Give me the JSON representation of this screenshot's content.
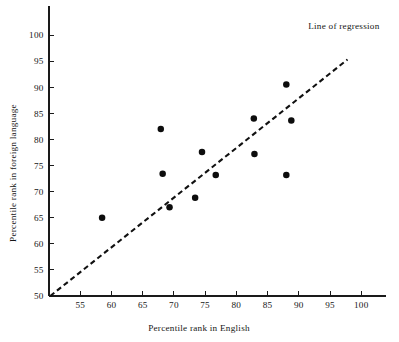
{
  "chart_data": {
    "type": "scatter",
    "title": "",
    "xlabel": "Percentile rank in English",
    "ylabel": "Percentile rank in foreign language",
    "xlim": [
      50,
      104
    ],
    "ylim": [
      50,
      104
    ],
    "xticks": [
      55,
      60,
      65,
      70,
      75,
      80,
      85,
      90,
      95,
      100
    ],
    "xtick_labels": [
      "55",
      "60",
      "65",
      "70",
      "75",
      "80",
      "85",
      "90",
      "95",
      "100"
    ],
    "yticks": [
      50,
      55,
      60,
      65,
      70,
      75,
      80,
      85,
      90,
      95,
      100
    ],
    "ytick_labels": [
      "50",
      "55",
      "60",
      "65",
      "70",
      "75",
      "80",
      "85",
      "90",
      "95",
      "100"
    ],
    "grid": false,
    "legend": false,
    "series": [
      {
        "name": "students",
        "marker": "filled-circle",
        "color": "#0d0d0d",
        "points": [
          {
            "x": 58.5,
            "y": 65.0
          },
          {
            "x": 67.9,
            "y": 82.0
          },
          {
            "x": 68.2,
            "y": 73.4
          },
          {
            "x": 69.3,
            "y": 67.0
          },
          {
            "x": 73.4,
            "y": 68.8
          },
          {
            "x": 74.5,
            "y": 77.6
          },
          {
            "x": 76.7,
            "y": 73.2
          },
          {
            "x": 82.8,
            "y": 84.0
          },
          {
            "x": 82.9,
            "y": 77.2
          },
          {
            "x": 88.0,
            "y": 90.5
          },
          {
            "x": 88.8,
            "y": 83.6
          },
          {
            "x": 88.0,
            "y": 73.2
          }
        ]
      }
    ],
    "annotations": [
      {
        "name": "regression-line",
        "type": "line",
        "style": "dashed",
        "color": "#111111",
        "x0": 50.2,
        "y0": 50.0,
        "x1": 97.8,
        "y1": 95.3
      },
      {
        "name": "regression-label",
        "type": "text",
        "text": "Line of regression",
        "x": 91.5,
        "y": 101.2
      }
    ]
  },
  "axes": {
    "x_title": "Percentile rank in English",
    "y_title": "Percentile rank in foreign language"
  },
  "annotation_text": {
    "regression": "Line of regression"
  },
  "colors": {
    "axis": "#1a1a1a",
    "point": "#0d0d0d",
    "line": "#111111",
    "background": "#ffffff"
  }
}
